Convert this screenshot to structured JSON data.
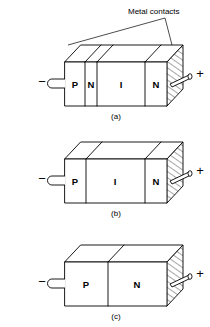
{
  "figure": {
    "title_annotation": "Metal contacts",
    "background_color": "#ffffff",
    "line_color": "#000000",
    "diagrams": [
      {
        "caption": "(a)",
        "terminal_left": "−",
        "terminal_right": "+",
        "regions": [
          {
            "label": "P"
          },
          {
            "label": "N"
          },
          {
            "label": "I"
          },
          {
            "label": "N"
          }
        ]
      },
      {
        "caption": "(b)",
        "terminal_left": "−",
        "terminal_right": "+",
        "regions": [
          {
            "label": "P"
          },
          {
            "label": "I"
          },
          {
            "label": "N"
          }
        ]
      },
      {
        "caption": "(c)",
        "terminal_left": "−",
        "terminal_right": "+",
        "regions": [
          {
            "label": "P"
          },
          {
            "label": "N"
          }
        ]
      }
    ]
  }
}
